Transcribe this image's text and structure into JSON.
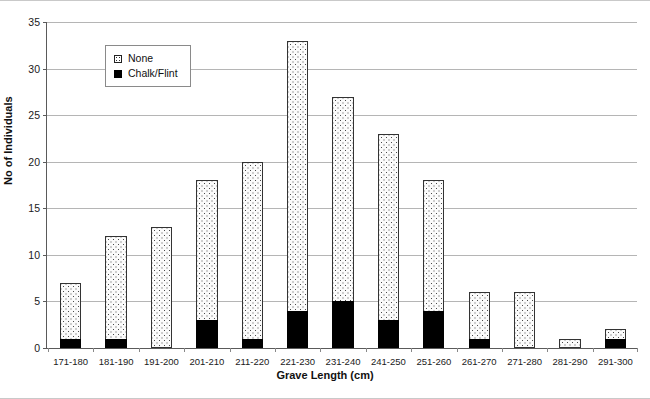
{
  "chart_data": {
    "type": "bar",
    "stacked": true,
    "title": "",
    "xlabel": "Grave Length (cm)",
    "ylabel": "No of Individuals",
    "ylim": [
      0,
      35
    ],
    "ytick_step": 5,
    "yticks": [
      0,
      5,
      10,
      15,
      20,
      25,
      30,
      35
    ],
    "grid": "horizontal",
    "legend_position": "inside-top-left",
    "categories": [
      "171-180",
      "181-190",
      "191-200",
      "201-210",
      "211-220",
      "221-230",
      "231-240",
      "241-250",
      "251-260",
      "261-270",
      "271-280",
      "281-290",
      "291-300"
    ],
    "series": [
      {
        "name": "Chalk/Flint",
        "pattern": "solid-black",
        "color": "#000000",
        "values": [
          1,
          1,
          0,
          3,
          1,
          4,
          5,
          3,
          4,
          1,
          0,
          0,
          1
        ]
      },
      {
        "name": "None",
        "pattern": "dotted-stipple",
        "color": "#ffffff",
        "values": [
          6,
          11,
          13,
          15,
          19,
          29,
          22,
          20,
          14,
          5,
          6,
          1,
          1
        ]
      }
    ],
    "totals": [
      7,
      12,
      13,
      18,
      20,
      33,
      27,
      23,
      18,
      6,
      6,
      1,
      2
    ]
  },
  "legend": {
    "items": [
      {
        "label": "None",
        "swatch": "dotted-stipple"
      },
      {
        "label": "Chalk/Flint",
        "swatch": "solid-black"
      }
    ]
  },
  "axes": {
    "y_title": "No of Individuals",
    "x_title": "Grave Length (cm)",
    "y_tick_labels": [
      "35",
      "30",
      "25",
      "20",
      "15",
      "10",
      "5",
      "0"
    ]
  }
}
